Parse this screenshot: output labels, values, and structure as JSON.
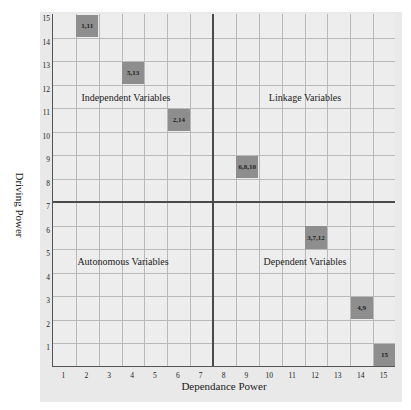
{
  "chart_data": {
    "type": "heatmap",
    "title": "",
    "xlabel": "Dependance Power",
    "ylabel": "Driving Power",
    "x_ticks": [
      "1",
      "2",
      "3",
      "4",
      "5",
      "6",
      "7",
      "8",
      "9",
      "10",
      "11",
      "12",
      "13",
      "14",
      "15"
    ],
    "y_ticks": [
      "1",
      "2",
      "3",
      "4",
      "5",
      "6",
      "7",
      "8",
      "9",
      "10",
      "11",
      "12",
      "13",
      "14",
      "15"
    ],
    "xlim": [
      0.5,
      15.5
    ],
    "ylim": [
      0.5,
      15.5
    ],
    "grid": true,
    "quadrant_dividers": {
      "x": 7.5,
      "y": 7.5
    },
    "quadrants": [
      {
        "name": "Independent Variables",
        "position": "top-left"
      },
      {
        "name": "Linkage Variables",
        "position": "top-right"
      },
      {
        "name": "Autonomous Variables",
        "position": "bottom-left"
      },
      {
        "name": "Dependent Variables",
        "position": "bottom-right"
      }
    ],
    "points": [
      {
        "label": "1,11",
        "x": 2,
        "y": 15
      },
      {
        "label": "5,13",
        "x": 4,
        "y": 13
      },
      {
        "label": "2,14",
        "x": 6,
        "y": 11
      },
      {
        "label": "6,8,10",
        "x": 9,
        "y": 9
      },
      {
        "label": "3,7,12",
        "x": 12,
        "y": 6
      },
      {
        "label": "4,9",
        "x": 14,
        "y": 3
      },
      {
        "label": "15",
        "x": 15,
        "y": 1
      }
    ]
  },
  "colors": {
    "panel_bg": "#e9e9e9",
    "plot_bg": "#ededed",
    "grid": "#b9b9b9",
    "divider": "#4a4a4a",
    "cell_fill": "#8e8e8e"
  }
}
